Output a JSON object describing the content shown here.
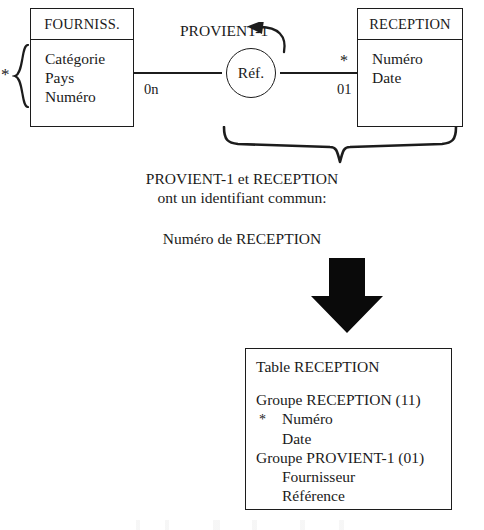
{
  "diagram": {
    "colors": {
      "ink": "#1c1c1c",
      "paper": "#ffffff"
    },
    "entities": [
      {
        "id": "fourniss",
        "title": "FOURNISS.",
        "attributes": [
          "Catégorie",
          "Pays",
          "Numéro"
        ],
        "identifier_marker": "*"
      },
      {
        "id": "reception",
        "title": "RECEPTION",
        "attributes": [
          "Numéro",
          "Date"
        ],
        "identifier_marker": "*"
      }
    ],
    "association": {
      "name": "PROVIENT-1",
      "circle_label": "Réf.",
      "arrow_direction": "left",
      "cardinality_left": "0n",
      "cardinality_right": "01"
    },
    "notes": {
      "line_1": "PROVIENT-1 et RECEPTION",
      "line_2": "ont un identifiant commun:",
      "line_3": "Numéro de RECEPTION"
    },
    "result_table": {
      "title": "Table RECEPTION",
      "lines": [
        {
          "text": "Groupe RECEPTION (11)",
          "indent": 0,
          "star": false
        },
        {
          "text": "Numéro",
          "indent": 1,
          "star": true
        },
        {
          "text": "Date",
          "indent": 1,
          "star": false
        },
        {
          "text": "Groupe PROVIENT-1 (01)",
          "indent": 0,
          "star": false
        },
        {
          "text": "Fournisseur",
          "indent": 1,
          "star": false
        },
        {
          "text": "Référence",
          "indent": 1,
          "star": false
        }
      ]
    }
  }
}
